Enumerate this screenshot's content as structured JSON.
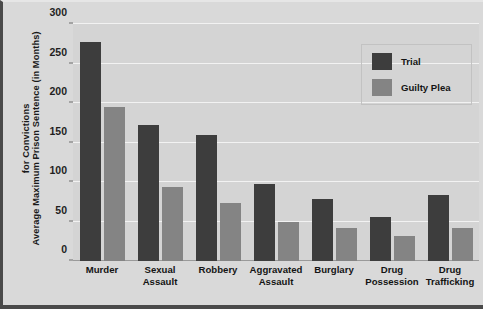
{
  "chart_data": {
    "type": "bar",
    "title": "",
    "xlabel": "",
    "ylabel_lines": [
      "Average Maximum Prison Sentence (in Months)",
      "for Convictions"
    ],
    "ylabel": "Average Maximum Prison Sentence (in Months) for Convictions",
    "categories": [
      "Murder",
      "Sexual Assault",
      "Robbery",
      "Aggravated Assault",
      "Burglary",
      "Drug Possession",
      "Drug Trafficking"
    ],
    "category_lines": [
      [
        "Murder"
      ],
      [
        "Sexual",
        "Assault"
      ],
      [
        "Robbery"
      ],
      [
        "Aggravated",
        "Assault"
      ],
      [
        "Burglary"
      ],
      [
        "Drug",
        "Possession"
      ],
      [
        "Drug",
        "Trafficking"
      ]
    ],
    "series": [
      {
        "name": "Trial",
        "color": "#3d3d3d",
        "values": [
          277,
          172,
          160,
          97,
          79,
          56,
          83
        ]
      },
      {
        "name": "Guilty Plea",
        "color": "#848484",
        "values": [
          195,
          94,
          74,
          49,
          42,
          32,
          42
        ]
      }
    ],
    "ylim": [
      0,
      300
    ],
    "yticks": [
      0,
      50,
      100,
      150,
      200,
      250,
      300
    ],
    "ytick_labels": [
      "0",
      "50",
      "100",
      "150",
      "200",
      "250",
      "300"
    ],
    "grid": true,
    "legend_position": "top-right",
    "legend_entries": [
      "Trial",
      "Guilty Plea"
    ],
    "colors": {
      "trial": "#3d3d3d",
      "guilty_plea": "#848484",
      "plot_background": "#d4d4d4",
      "figure_background": "#d9d9d9",
      "gridline": "#f2f2f2",
      "border": "#4a4a4a"
    }
  }
}
